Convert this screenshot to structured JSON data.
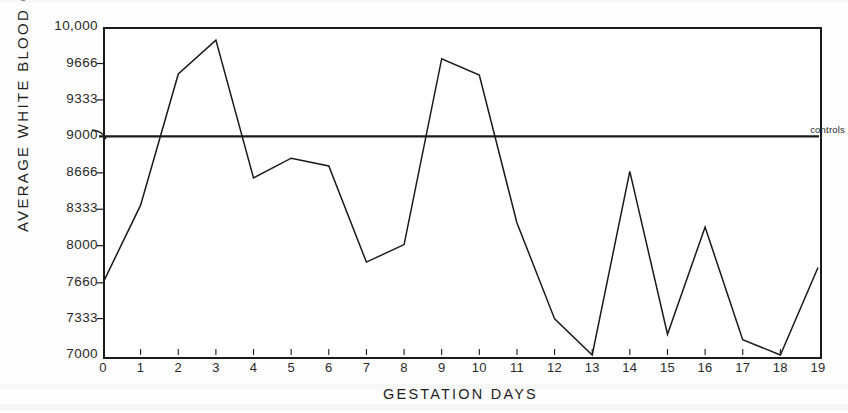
{
  "chart_data": {
    "type": "line",
    "title": "",
    "xlabel": "GESTATION DAYS",
    "ylabel": "AVERAGE WHITE BLOOD CELL COUNT",
    "xlim": [
      0,
      19
    ],
    "ylim": [
      7000,
      10000
    ],
    "grid": false,
    "legend_position": "none",
    "x": [
      0,
      1,
      2,
      3,
      4,
      5,
      6,
      7,
      8,
      9,
      10,
      11,
      12,
      13,
      14,
      15,
      16,
      17,
      18,
      19
    ],
    "values": [
      7660,
      8370,
      9570,
      9880,
      8620,
      8800,
      8730,
      7850,
      8010,
      9710,
      9560,
      8210,
      7330,
      7000,
      8680,
      7190,
      8170,
      7140,
      7000,
      7800
    ],
    "series": [
      {
        "name": "Average white blood cell count",
        "values": [
          7660,
          8370,
          9570,
          9880,
          8620,
          8800,
          8730,
          7850,
          8010,
          9710,
          9560,
          8210,
          7330,
          7000,
          8680,
          7190,
          8170,
          7140,
          7000,
          7800
        ]
      }
    ],
    "xtick_labels": [
      "0",
      "1",
      "2",
      "3",
      "4",
      "5",
      "6",
      "7",
      "8",
      "9",
      "10",
      "11",
      "12",
      "13",
      "14",
      "15",
      "16",
      "17",
      "18",
      "19"
    ],
    "ytick_values": [
      7000,
      7333,
      7660,
      8000,
      8333,
      8666,
      9000,
      9333,
      9666,
      10000
    ],
    "ytick_labels": [
      "7000",
      "7333",
      "7660",
      "8000",
      "8333",
      "8666",
      "9000",
      "9333",
      "9666",
      "10,000"
    ],
    "annotations": [
      {
        "label": "controls",
        "value": 9000,
        "description": "horizontal reference line at 9000 labelled controls"
      }
    ],
    "reference_line": {
      "label": "controls",
      "value": 9000
    },
    "line_color": "#1a1a1a",
    "axis_color": "#1a1a1a",
    "background_color": "#ffffff"
  }
}
